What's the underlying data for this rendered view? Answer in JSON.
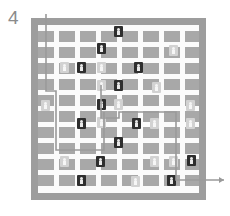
{
  "figure": {
    "label": "4",
    "caption_text": "4",
    "type": "grid-maze-routing-diagram"
  },
  "colors": {
    "page_background": "#ffffff",
    "frame": "#9d9d9d",
    "channel": "#fbfbfb",
    "block": "#a8a8a8",
    "marker_dark": "#2e2e2e",
    "marker_dark_glyph": "#e9e9e9",
    "marker_light": "#d2d2d2",
    "marker_light_glyph": "#f6f6f6",
    "path_line": "#9a9a9a",
    "label_text": "#8b8b8b"
  },
  "board": {
    "rows": 8,
    "cols": 8,
    "frame": {
      "x": 31,
      "y": 18,
      "width": 175,
      "height": 182
    },
    "field": {
      "x": 38,
      "y": 25,
      "width": 161,
      "height": 168
    },
    "cell_size": 16,
    "channel_width": 5,
    "block_size": 16
  },
  "blocks": [
    {
      "x": 38,
      "y": 31,
      "w": 16,
      "h": 11
    },
    {
      "x": 59,
      "y": 31,
      "w": 16,
      "h": 11
    },
    {
      "x": 80,
      "y": 31,
      "w": 16,
      "h": 11
    },
    {
      "x": 101,
      "y": 31,
      "w": 16,
      "h": 11
    },
    {
      "x": 122,
      "y": 31,
      "w": 16,
      "h": 11
    },
    {
      "x": 143,
      "y": 31,
      "w": 16,
      "h": 11
    },
    {
      "x": 164,
      "y": 31,
      "w": 16,
      "h": 11
    },
    {
      "x": 185,
      "y": 31,
      "w": 14,
      "h": 11
    },
    {
      "x": 38,
      "y": 47,
      "w": 16,
      "h": 11
    },
    {
      "x": 59,
      "y": 47,
      "w": 16,
      "h": 11
    },
    {
      "x": 80,
      "y": 47,
      "w": 16,
      "h": 11
    },
    {
      "x": 101,
      "y": 47,
      "w": 16,
      "h": 11
    },
    {
      "x": 122,
      "y": 47,
      "w": 16,
      "h": 11
    },
    {
      "x": 143,
      "y": 47,
      "w": 16,
      "h": 11
    },
    {
      "x": 164,
      "y": 47,
      "w": 16,
      "h": 11
    },
    {
      "x": 185,
      "y": 47,
      "w": 14,
      "h": 11
    },
    {
      "x": 38,
      "y": 63,
      "w": 16,
      "h": 11
    },
    {
      "x": 59,
      "y": 63,
      "w": 16,
      "h": 11
    },
    {
      "x": 80,
      "y": 63,
      "w": 16,
      "h": 11
    },
    {
      "x": 101,
      "y": 63,
      "w": 16,
      "h": 11
    },
    {
      "x": 122,
      "y": 63,
      "w": 16,
      "h": 11
    },
    {
      "x": 143,
      "y": 63,
      "w": 16,
      "h": 11
    },
    {
      "x": 164,
      "y": 63,
      "w": 16,
      "h": 11
    },
    {
      "x": 185,
      "y": 63,
      "w": 14,
      "h": 11
    },
    {
      "x": 38,
      "y": 79,
      "w": 16,
      "h": 11
    },
    {
      "x": 59,
      "y": 79,
      "w": 16,
      "h": 11
    },
    {
      "x": 80,
      "y": 79,
      "w": 16,
      "h": 11
    },
    {
      "x": 101,
      "y": 79,
      "w": 16,
      "h": 11
    },
    {
      "x": 122,
      "y": 79,
      "w": 16,
      "h": 11
    },
    {
      "x": 143,
      "y": 79,
      "w": 16,
      "h": 11
    },
    {
      "x": 164,
      "y": 79,
      "w": 16,
      "h": 11
    },
    {
      "x": 185,
      "y": 79,
      "w": 14,
      "h": 11
    },
    {
      "x": 38,
      "y": 95,
      "w": 16,
      "h": 11
    },
    {
      "x": 59,
      "y": 95,
      "w": 16,
      "h": 11
    },
    {
      "x": 80,
      "y": 95,
      "w": 16,
      "h": 11
    },
    {
      "x": 101,
      "y": 95,
      "w": 16,
      "h": 11
    },
    {
      "x": 122,
      "y": 95,
      "w": 16,
      "h": 11
    },
    {
      "x": 143,
      "y": 95,
      "w": 16,
      "h": 11
    },
    {
      "x": 164,
      "y": 95,
      "w": 16,
      "h": 11
    },
    {
      "x": 185,
      "y": 95,
      "w": 14,
      "h": 11
    },
    {
      "x": 38,
      "y": 111,
      "w": 16,
      "h": 11
    },
    {
      "x": 59,
      "y": 111,
      "w": 16,
      "h": 11
    },
    {
      "x": 80,
      "y": 111,
      "w": 16,
      "h": 11
    },
    {
      "x": 101,
      "y": 111,
      "w": 16,
      "h": 11
    },
    {
      "x": 122,
      "y": 111,
      "w": 16,
      "h": 11
    },
    {
      "x": 143,
      "y": 111,
      "w": 16,
      "h": 11
    },
    {
      "x": 164,
      "y": 111,
      "w": 16,
      "h": 11
    },
    {
      "x": 185,
      "y": 111,
      "w": 14,
      "h": 11
    },
    {
      "x": 38,
      "y": 127,
      "w": 16,
      "h": 11
    },
    {
      "x": 59,
      "y": 127,
      "w": 16,
      "h": 11
    },
    {
      "x": 80,
      "y": 127,
      "w": 16,
      "h": 11
    },
    {
      "x": 101,
      "y": 127,
      "w": 16,
      "h": 11
    },
    {
      "x": 122,
      "y": 127,
      "w": 16,
      "h": 11
    },
    {
      "x": 143,
      "y": 127,
      "w": 16,
      "h": 11
    },
    {
      "x": 164,
      "y": 127,
      "w": 16,
      "h": 11
    },
    {
      "x": 185,
      "y": 127,
      "w": 14,
      "h": 11
    },
    {
      "x": 38,
      "y": 143,
      "w": 16,
      "h": 11
    },
    {
      "x": 59,
      "y": 143,
      "w": 16,
      "h": 11
    },
    {
      "x": 80,
      "y": 143,
      "w": 16,
      "h": 11
    },
    {
      "x": 101,
      "y": 143,
      "w": 16,
      "h": 11
    },
    {
      "x": 122,
      "y": 143,
      "w": 16,
      "h": 11
    },
    {
      "x": 143,
      "y": 143,
      "w": 16,
      "h": 11
    },
    {
      "x": 164,
      "y": 143,
      "w": 16,
      "h": 11
    },
    {
      "x": 185,
      "y": 143,
      "w": 14,
      "h": 11
    },
    {
      "x": 38,
      "y": 159,
      "w": 16,
      "h": 11
    },
    {
      "x": 59,
      "y": 159,
      "w": 16,
      "h": 11
    },
    {
      "x": 80,
      "y": 159,
      "w": 16,
      "h": 11
    },
    {
      "x": 101,
      "y": 159,
      "w": 16,
      "h": 11
    },
    {
      "x": 122,
      "y": 159,
      "w": 16,
      "h": 11
    },
    {
      "x": 143,
      "y": 159,
      "w": 16,
      "h": 11
    },
    {
      "x": 164,
      "y": 159,
      "w": 16,
      "h": 11
    },
    {
      "x": 185,
      "y": 159,
      "w": 14,
      "h": 11
    },
    {
      "x": 38,
      "y": 175,
      "w": 16,
      "h": 11
    },
    {
      "x": 59,
      "y": 175,
      "w": 16,
      "h": 11
    },
    {
      "x": 80,
      "y": 175,
      "w": 16,
      "h": 11
    },
    {
      "x": 101,
      "y": 175,
      "w": 16,
      "h": 11
    },
    {
      "x": 122,
      "y": 175,
      "w": 16,
      "h": 11
    },
    {
      "x": 143,
      "y": 175,
      "w": 16,
      "h": 11
    },
    {
      "x": 164,
      "y": 175,
      "w": 16,
      "h": 11
    },
    {
      "x": 185,
      "y": 175,
      "w": 14,
      "h": 11
    }
  ],
  "markers": [
    {
      "id": "m01",
      "x": 114,
      "y": 26,
      "variant": "dark"
    },
    {
      "id": "m02",
      "x": 97,
      "y": 43,
      "variant": "dark"
    },
    {
      "id": "m03",
      "x": 169,
      "y": 45,
      "variant": "light"
    },
    {
      "id": "m04",
      "x": 60,
      "y": 62,
      "variant": "light"
    },
    {
      "id": "m05",
      "x": 77,
      "y": 62,
      "variant": "dark"
    },
    {
      "id": "m06",
      "x": 97,
      "y": 62,
      "variant": "light"
    },
    {
      "id": "m07",
      "x": 134,
      "y": 62,
      "variant": "dark"
    },
    {
      "id": "m08",
      "x": 97,
      "y": 80,
      "variant": "light"
    },
    {
      "id": "m09",
      "x": 114,
      "y": 80,
      "variant": "dark"
    },
    {
      "id": "m10",
      "x": 152,
      "y": 82,
      "variant": "light"
    },
    {
      "id": "m11",
      "x": 41,
      "y": 100,
      "variant": "light"
    },
    {
      "id": "m12",
      "x": 97,
      "y": 99,
      "variant": "dark"
    },
    {
      "id": "m13",
      "x": 114,
      "y": 99,
      "variant": "light"
    },
    {
      "id": "m14",
      "x": 186,
      "y": 100,
      "variant": "light"
    },
    {
      "id": "m15",
      "x": 77,
      "y": 118,
      "variant": "dark"
    },
    {
      "id": "m16",
      "x": 97,
      "y": 117,
      "variant": "light"
    },
    {
      "id": "m17",
      "x": 132,
      "y": 118,
      "variant": "dark"
    },
    {
      "id": "m18",
      "x": 150,
      "y": 118,
      "variant": "light"
    },
    {
      "id": "m19",
      "x": 186,
      "y": 118,
      "variant": "light"
    },
    {
      "id": "m20",
      "x": 114,
      "y": 137,
      "variant": "dark"
    },
    {
      "id": "m21",
      "x": 60,
      "y": 156,
      "variant": "light"
    },
    {
      "id": "m22",
      "x": 96,
      "y": 156,
      "variant": "dark"
    },
    {
      "id": "m23",
      "x": 150,
      "y": 156,
      "variant": "light"
    },
    {
      "id": "m24",
      "x": 169,
      "y": 156,
      "variant": "light"
    },
    {
      "id": "m25",
      "x": 187,
      "y": 155,
      "variant": "dark"
    },
    {
      "id": "m26",
      "x": 77,
      "y": 175,
      "variant": "dark"
    },
    {
      "id": "m27",
      "x": 131,
      "y": 176,
      "variant": "light"
    },
    {
      "id": "m28",
      "x": 167,
      "y": 175,
      "variant": "dark"
    }
  ],
  "path": {
    "stroke_color": "#9a9a9a",
    "stroke_width": 1.6,
    "entry_label": "top-left inlet",
    "exit_label": "bottom-right outlet with arrow",
    "segments": [
      "M 46 14 L 46 91 L 56 91 L 56 150 L 104 150 L 104 112",
      "M 101 85 L 101 118 L 119 118 L 119 112 L 176 112 L 176 180 L 224 180"
    ],
    "arrow_tip": {
      "x": 224,
      "y": 180
    }
  }
}
